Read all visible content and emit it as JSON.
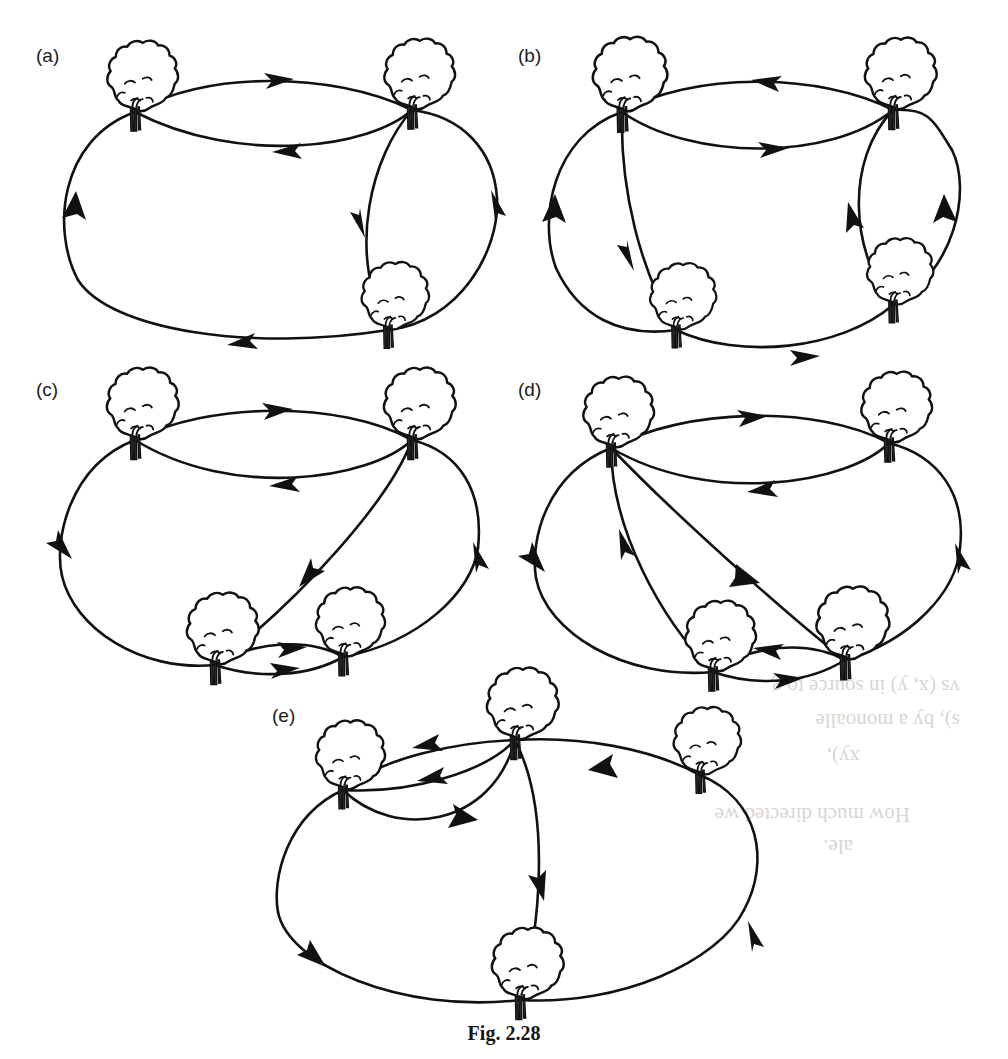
{
  "figure": {
    "caption": "Fig. 2.28",
    "background_color": "#ffffff",
    "ink_color": "#111111",
    "node_icon": "tree-icon",
    "edge_icon": "directed-arc-icon"
  },
  "panels": [
    {
      "id": "a",
      "label": "(a)",
      "vertex_count": 3,
      "vertices": [
        {
          "name": "top-left-tree",
          "x": 135,
          "y": 112
        },
        {
          "name": "top-right-tree",
          "x": 412,
          "y": 110
        },
        {
          "name": "bottom-tree",
          "x": 388,
          "y": 330
        }
      ],
      "edges": [
        {
          "from": "top-left-tree",
          "to": "top-right-tree",
          "arrow": "right",
          "curve": "outer-upper"
        },
        {
          "from": "top-right-tree",
          "to": "top-left-tree",
          "arrow": "left",
          "curve": "inner-lower"
        },
        {
          "from": "top-right-tree",
          "to": "bottom-tree",
          "arrow": "down",
          "curve": "inner-right"
        },
        {
          "from": "top-left-tree",
          "to": "bottom-tree",
          "arrow": "up",
          "curve": "outer-left"
        },
        {
          "from": "bottom-tree",
          "to": "top-left-tree",
          "arrow": "left",
          "curve": "outer-bottom"
        },
        {
          "from": "bottom-tree",
          "to": "top-right-tree",
          "arrow": "up",
          "curve": "outer-right"
        }
      ]
    },
    {
      "id": "b",
      "label": "(b)",
      "vertex_count": 4,
      "vertices": [
        {
          "name": "top-left-tree",
          "x": 622,
          "y": 112
        },
        {
          "name": "top-right-tree",
          "x": 893,
          "y": 110
        },
        {
          "name": "bottom-left-tree",
          "x": 676,
          "y": 330
        },
        {
          "name": "bottom-right-tree",
          "x": 893,
          "y": 305
        }
      ],
      "edges": [
        {
          "from": "top-right-tree",
          "to": "top-left-tree",
          "arrow": "left",
          "curve": "outer-upper"
        },
        {
          "from": "top-left-tree",
          "to": "top-right-tree",
          "arrow": "right",
          "curve": "inner-lower"
        },
        {
          "from": "top-left-tree",
          "to": "bottom-left-tree",
          "arrow": "down",
          "curve": "near-vertical"
        },
        {
          "from": "bottom-left-tree",
          "to": "top-left-tree",
          "arrow": "up",
          "curve": "outer-left"
        },
        {
          "from": "bottom-left-tree",
          "to": "bottom-right-tree",
          "arrow": "right",
          "curve": "outer-bottom"
        },
        {
          "from": "bottom-right-tree",
          "to": "top-right-tree",
          "arrow": "up",
          "curve": "inner-right"
        },
        {
          "from": "top-right-tree",
          "to": "bottom-right-tree",
          "arrow": "down",
          "curve": "outer-right"
        }
      ]
    },
    {
      "id": "c",
      "label": "(c)",
      "vertex_count": 4,
      "vertices": [
        {
          "name": "top-left-tree",
          "x": 135,
          "y": 440
        },
        {
          "name": "top-right-tree",
          "x": 412,
          "y": 440
        },
        {
          "name": "bottom-left-tree",
          "x": 215,
          "y": 665
        },
        {
          "name": "bottom-right-tree",
          "x": 343,
          "y": 657
        }
      ],
      "edges": [
        {
          "from": "top-left-tree",
          "to": "top-right-tree",
          "arrow": "right",
          "curve": "outer-upper"
        },
        {
          "from": "top-right-tree",
          "to": "top-left-tree",
          "arrow": "left",
          "curve": "inner-lower"
        },
        {
          "from": "top-left-tree",
          "to": "bottom-left-tree",
          "arrow": "down",
          "curve": "outer-left"
        },
        {
          "from": "top-right-tree",
          "to": "bottom-left-tree",
          "arrow": "down-left",
          "curve": "diagonal"
        },
        {
          "from": "bottom-left-tree",
          "to": "bottom-right-tree",
          "arrow": "right",
          "curve": "inner-upper"
        },
        {
          "from": "bottom-left-tree",
          "to": "bottom-right-tree",
          "arrow": "right",
          "curve": "outer-bottom"
        },
        {
          "from": "bottom-right-tree",
          "to": "top-right-tree",
          "arrow": "up",
          "curve": "outer-right"
        }
      ]
    },
    {
      "id": "d",
      "label": "(d)",
      "vertex_count": 4,
      "vertices": [
        {
          "name": "top-left-tree",
          "x": 611,
          "y": 448
        },
        {
          "name": "top-right-tree",
          "x": 889,
          "y": 443
        },
        {
          "name": "bottom-left-tree",
          "x": 713,
          "y": 672
        },
        {
          "name": "bottom-right-tree",
          "x": 845,
          "y": 660
        }
      ],
      "edges": [
        {
          "from": "top-left-tree",
          "to": "top-right-tree",
          "arrow": "right",
          "curve": "outer-upper"
        },
        {
          "from": "top-right-tree",
          "to": "top-left-tree",
          "arrow": "left",
          "curve": "inner-lower"
        },
        {
          "from": "top-left-tree",
          "to": "bottom-left-tree",
          "arrow": "down",
          "curve": "outer-left"
        },
        {
          "from": "bottom-left-tree",
          "to": "top-left-tree",
          "arrow": "up",
          "curve": "inner-left"
        },
        {
          "from": "top-left-tree",
          "to": "bottom-right-tree",
          "arrow": "down-right",
          "curve": "diagonal"
        },
        {
          "from": "bottom-right-tree",
          "to": "bottom-left-tree",
          "arrow": "left",
          "curve": "inner-upper"
        },
        {
          "from": "bottom-left-tree",
          "to": "bottom-right-tree",
          "arrow": "right",
          "curve": "outer-bottom"
        },
        {
          "from": "bottom-right-tree",
          "to": "top-right-tree",
          "arrow": "up",
          "curve": "outer-right"
        }
      ]
    },
    {
      "id": "e",
      "label": "(e)",
      "vertex_count": 4,
      "vertices": [
        {
          "name": "left-tree",
          "x": 343,
          "y": 790
        },
        {
          "name": "top-tree",
          "x": 515,
          "y": 740
        },
        {
          "name": "right-tree",
          "x": 700,
          "y": 775
        },
        {
          "name": "bottom-tree",
          "x": 520,
          "y": 1000
        }
      ],
      "edges": [
        {
          "from": "top-tree",
          "to": "left-tree",
          "arrow": "left",
          "curve": "upper"
        },
        {
          "from": "top-tree",
          "to": "left-tree",
          "arrow": "left",
          "curve": "middle"
        },
        {
          "from": "left-tree",
          "to": "top-tree",
          "arrow": "right",
          "curve": "lower"
        },
        {
          "from": "top-tree",
          "to": "bottom-tree",
          "arrow": "down",
          "curve": "inner-center"
        },
        {
          "from": "left-tree",
          "to": "bottom-tree",
          "arrow": "down",
          "curve": "outer-left"
        },
        {
          "from": "bottom-tree",
          "to": "right-tree",
          "arrow": "up",
          "curve": "outer-right"
        },
        {
          "from": "right-tree",
          "to": "top-tree",
          "arrow": "left",
          "curve": "outer-upper-right"
        }
      ]
    }
  ],
  "background_text": {
    "note": "faint show-through text from reverse of page",
    "lines": [
      "vs (x, y) in source to g",
      "s), by a monoalle",
      "xy),",
      "How much directed we",
      "ale."
    ]
  }
}
